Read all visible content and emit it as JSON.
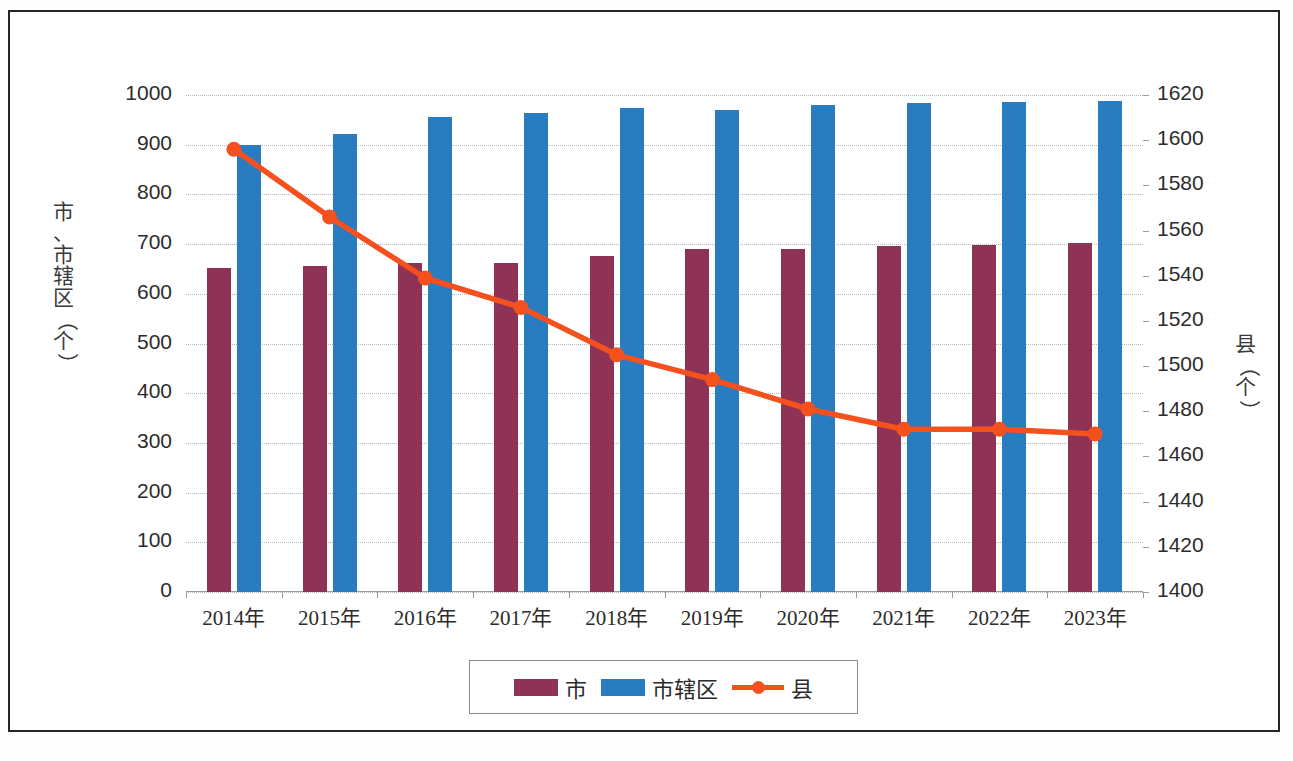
{
  "chart_data": {
    "type": "bar",
    "title": "",
    "subtitle": "",
    "xlabel": "",
    "ylabel": "市、市辖区（个）",
    "y2label": "县（个）",
    "grid": true,
    "legend_position": "bottom",
    "categories": [
      "2014年",
      "2015年",
      "2016年",
      "2017年",
      "2018年",
      "2019年",
      "2020年",
      "2021年",
      "2022年",
      "2023年"
    ],
    "ylim": [
      0,
      1000
    ],
    "y_ticks": [
      "0",
      "100",
      "200",
      "300",
      "400",
      "500",
      "600",
      "700",
      "800",
      "900",
      "1000"
    ],
    "y2lim": [
      1400,
      1620
    ],
    "y2_ticks": [
      "1400",
      "1420",
      "1440",
      "1460",
      "1480",
      "1500",
      "1520",
      "1540",
      "1560",
      "1580",
      "1600",
      "1620"
    ],
    "series": [
      {
        "name": "市",
        "type": "bar",
        "axis": "left",
        "color": "#8e3256",
        "values": [
          652,
          656,
          661,
          663,
          677,
          690,
          691,
          697,
          699,
          702
        ]
      },
      {
        "name": "市辖区",
        "type": "bar",
        "axis": "left",
        "color": "#2a7cc0",
        "values": [
          899,
          921,
          956,
          964,
          973,
          970,
          979,
          984,
          985,
          987
        ]
      },
      {
        "name": "县",
        "type": "line",
        "axis": "right",
        "color": "#f4511e",
        "marker": "circle",
        "values": [
          1596,
          1566,
          1539,
          1526,
          1505,
          1494,
          1481,
          1472,
          1472,
          1470
        ]
      }
    ]
  },
  "legend": {
    "items": [
      {
        "label": "市",
        "color": "#8e3256",
        "kind": "swatch"
      },
      {
        "label": "市辖区",
        "color": "#2a7cc0",
        "kind": "swatch"
      },
      {
        "label": "县",
        "color": "#f4511e",
        "kind": "line"
      }
    ]
  }
}
